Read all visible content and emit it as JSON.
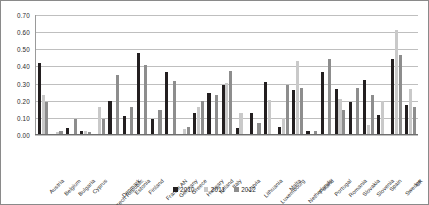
{
  "chart_data": {
    "type": "bar",
    "title": "",
    "xlabel": "",
    "ylabel": "",
    "ylim": [
      0.0,
      0.7
    ],
    "ytick_labels": [
      "0.70",
      "0.60",
      "0.50",
      "0.40",
      "0.30",
      "0.20",
      "0.10",
      "0.00"
    ],
    "ytick_values": [
      0.7,
      0.6,
      0.5,
      0.4,
      0.3,
      0.2,
      0.1,
      0.0
    ],
    "grid": true,
    "legend_position": "bottom",
    "categories": [
      "Austria",
      "Belgium",
      "Bulgaria",
      "Cyprus",
      "Czech Republic",
      "Denmark",
      "Estonia",
      "Finland",
      "France AN",
      "Germany",
      "Greece",
      "Hungary",
      "Ireland",
      "Italy",
      "Latvia",
      "Lithuania",
      "Luxembourg",
      "Malta",
      "Netherlands",
      "Poland",
      "Portugal",
      "Romania",
      "Slovakia",
      "Slovenia",
      "Spain",
      "Sweden",
      "UK"
    ],
    "series": [
      {
        "name": "2010",
        "color": "#231f20",
        "values": [
          0.415,
          0.0,
          0.035,
          0.02,
          0.0,
          0.195,
          0.105,
          0.475,
          0.085,
          0.36,
          0.0,
          0.125,
          0.24,
          0.285,
          0.035,
          0.125,
          0.305,
          0.04,
          0.255,
          0.015,
          0.36,
          0.265,
          0.185,
          0.315,
          0.11,
          0.435,
          0.17
        ]
      },
      {
        "name": "2011",
        "color": "#c9c9c9",
        "values": [
          0.23,
          0.01,
          0.0,
          0.015,
          0.155,
          0.0,
          0.0,
          0.0,
          0.0,
          0.0,
          0.03,
          0.16,
          0.0,
          0.295,
          0.12,
          0.0,
          0.2,
          0.095,
          0.0,
          0.0,
          0.0,
          0.205,
          0.0,
          0.05,
          0.195,
          0.0,
          0.0
        ]
      },
      {
        "name": "2012",
        "color": "#8d8d8d",
        "values": [
          0.185,
          0.02,
          0.09,
          0.01,
          0.085,
          0.345,
          0.16,
          0.4,
          0.14,
          0.31,
          0.04,
          0.19,
          0.225,
          0.37,
          0.0,
          0.065,
          0.0,
          0.285,
          0.27,
          0.02,
          0.435,
          0.14,
          0.27,
          0.225,
          0.0,
          0.46,
          0.155
        ]
      }
    ],
    "series_extra": {
      "note_2011_tall": [
        {
          "category": "Netherlands",
          "value": 0.425
        },
        {
          "category": "Portugal",
          "value": 0.0
        },
        {
          "category": "Sweden",
          "value": 0.605
        },
        {
          "category": "UK",
          "value": 0.26
        },
        {
          "category": "Estonia",
          "value": 0.0
        }
      ]
    }
  },
  "legend": {
    "items": [
      {
        "label": "2010",
        "color": "#231f20"
      },
      {
        "label": "2011",
        "color": "#c9c9c9"
      },
      {
        "label": "2012",
        "color": "#8d8d8d"
      }
    ]
  }
}
